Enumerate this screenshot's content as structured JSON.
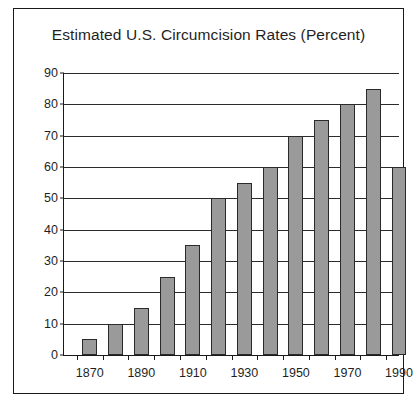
{
  "chart_data": {
    "type": "bar",
    "title": "Estimated U.S. Circumcision Rates (Percent)",
    "xlabel": "",
    "ylabel": "",
    "categories": [
      "1870",
      "1880",
      "1890",
      "1900",
      "1910",
      "1920",
      "1930",
      "1940",
      "1950",
      "1960",
      "1970",
      "1980",
      "1990"
    ],
    "values": [
      5,
      10,
      15,
      25,
      35,
      50,
      55,
      60,
      70,
      75,
      80,
      85,
      60
    ],
    "ylim": [
      0,
      90
    ],
    "ytick_values": [
      0,
      10,
      20,
      30,
      40,
      50,
      60,
      70,
      80,
      90
    ],
    "ytick_labels": [
      "0",
      "10",
      "20",
      "30",
      "40",
      "50",
      "60",
      "70",
      "80",
      "90"
    ],
    "xtick_labels": [
      "1870",
      "1890",
      "1910",
      "1930",
      "1950",
      "1970",
      "1990"
    ],
    "xtick_label_values": [
      1870,
      1890,
      1910,
      1930,
      1950,
      1970,
      1990
    ],
    "xtick_mark_values": [
      1870,
      1880,
      1890,
      1900,
      1910,
      1920,
      1930,
      1940,
      1950,
      1960,
      1970,
      1980,
      1990
    ],
    "xlim": [
      1865,
      1995
    ],
    "grid": true,
    "legend": false,
    "bar_color": "#9a9a9a",
    "bar_edge_color": "#2a2a2a",
    "axis_color": "#1a1a1a",
    "background_color": "#ffffff"
  }
}
